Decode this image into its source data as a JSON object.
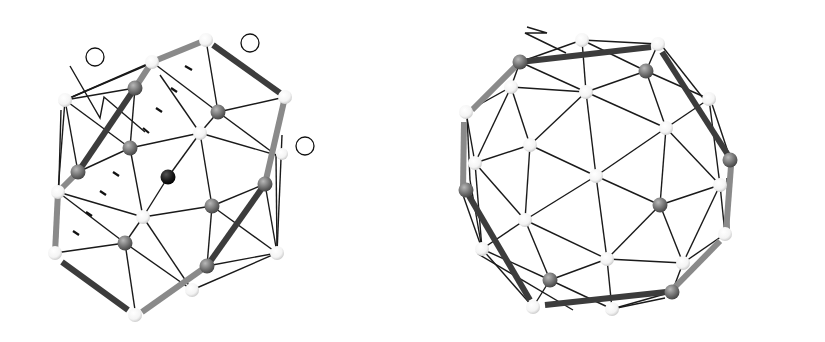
{
  "figure": {
    "panels": [
      {
        "id": "B",
        "title": "B",
        "labels": {
          "tau2": {
            "prefix": "tau",
            "circled": "2",
            "suffix": ""
          },
          "two_over_tau": {
            "prefix": "",
            "circled": "2",
            "suffix": "/tau"
          },
          "three_over_tau": {
            "prefix": "",
            "circled": "3",
            "suffix": "/tau"
          },
          "b": "b",
          "q": "q"
        }
      },
      {
        "id": "Mc",
        "title": "Mc",
        "labels": {
          "five": {
            "prefix": "",
            "circled": "5",
            "suffix": ""
          },
          "three_over_tau": {
            "prefix": "",
            "circled": "3",
            "suffix": "/tau"
          },
          "q_top": "q",
          "b": "b",
          "q_bottom": "q"
        }
      }
    ],
    "legend_colors": {
      "white_atom": "#ffffff",
      "gray_atom": "#7a7a7a",
      "black_atom": "#151515",
      "dark_bar": "#3c3c3c",
      "light_bar": "#8a8a8a",
      "edge": "#1a1a1a"
    }
  }
}
